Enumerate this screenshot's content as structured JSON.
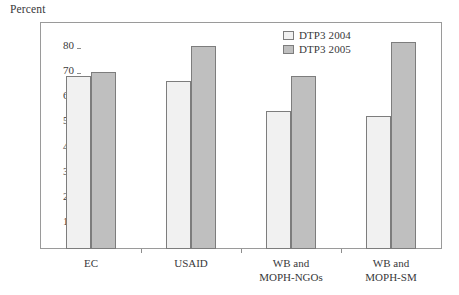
{
  "chart_data": {
    "type": "bar",
    "title": "",
    "subtitle": "",
    "xlabel": "",
    "ylabel": "Percent",
    "categories": [
      "EC",
      "USAID",
      "WB and MOPH-NGOs",
      "WB and MOPH-SM"
    ],
    "category_lines": [
      [
        "EC"
      ],
      [
        "USAID"
      ],
      [
        "WB and",
        "MOPH-NGOs"
      ],
      [
        "WB and",
        "MOPH-SM"
      ]
    ],
    "series": [
      {
        "name": "DTP3 2004",
        "color": "#f1f1f1",
        "values": [
          69,
          67,
          55,
          53
        ]
      },
      {
        "name": "DTP3 2005",
        "color": "#bfbfbf",
        "values": [
          70.5,
          81,
          69,
          82.5
        ]
      }
    ],
    "ylim": [
      0,
      90
    ],
    "yticks": [
      10,
      20,
      30,
      40,
      50,
      60,
      70,
      80
    ],
    "ytick_labels": [
      "10",
      "20",
      "30",
      "40",
      "50",
      "60",
      "70",
      "80"
    ],
    "grid": false,
    "legend_position": "top-right-inside",
    "frame": true,
    "border_color": "#7d7d7d",
    "axis_color": "#9a9a9a"
  },
  "legend": {
    "items": [
      {
        "label": "DTP3 2004"
      },
      {
        "label": "DTP3 2005"
      }
    ]
  }
}
